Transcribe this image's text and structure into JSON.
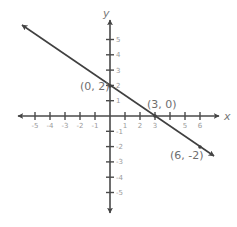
{
  "chart_data": {
    "type": "line",
    "title": "",
    "xlabel": "x",
    "ylabel": "y",
    "xlim": [
      -6,
      7
    ],
    "ylim": [
      -6,
      6
    ],
    "grid": false,
    "x_ticks": [
      -5,
      -4,
      -3,
      -2,
      -1,
      1,
      2,
      3,
      4,
      5,
      6
    ],
    "x_tick_labels": [
      "-5",
      "-4",
      "-3",
      "-2",
      "-1",
      "1",
      "2",
      "3",
      "",
      "5",
      "6"
    ],
    "y_ticks": [
      5,
      4,
      3,
      2,
      1,
      -1,
      -2,
      -3,
      -4,
      -5
    ],
    "y_tick_labels": [
      "5",
      "4",
      "3",
      "2",
      "1",
      "-1",
      "-2",
      "-3",
      "-4",
      "-5"
    ],
    "series": [
      {
        "name": "line",
        "equation": "y = -2/3 x + 2",
        "x": [
          0,
          3,
          6
        ],
        "y": [
          2,
          0,
          -2
        ],
        "arrows_both_ends": true
      }
    ],
    "annotations": [
      {
        "text": "(0, 2)",
        "x": 0,
        "y": 2
      },
      {
        "text": "(3, 0)",
        "x": 3,
        "y": 0
      },
      {
        "text": "(6, -2)",
        "x": 6,
        "y": -2
      }
    ]
  },
  "colors": {
    "axis": "#4a4a4a",
    "line": "#404040",
    "tick_label": "#9a9a9a",
    "point_label": "#6e6e6e"
  }
}
